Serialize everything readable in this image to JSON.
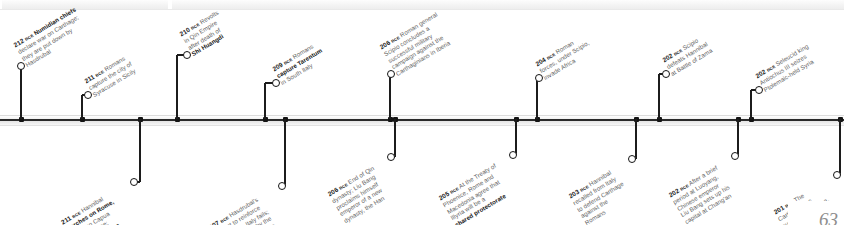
{
  "figure": {
    "type": "historical-timeline",
    "orientation": "horizontal",
    "era_suffix": "BCE",
    "page_number": "63",
    "axis_color": "#1c1c1c",
    "text_color": "#5d5d5d",
    "emphasis_color": "#151515"
  },
  "events": [
    {
      "id": "e-212-numidian",
      "side": "above",
      "year": "212",
      "era": "BCE",
      "lines": [
        {
          "text": "Numidian chiefs",
          "bold": true
        },
        {
          "text": "declare war on Carthage;",
          "bold": false
        },
        {
          "text": "they are put down by",
          "bold": false
        },
        {
          "text": "Hasdrubal",
          "bold": false
        }
      ]
    },
    {
      "id": "e-211-syracuse",
      "side": "above",
      "year": "211",
      "era": "BCE",
      "lines": [
        {
          "text": "Romans",
          "bold": false
        },
        {
          "text": "capture the city of",
          "bold": false
        },
        {
          "text": "Syracuse in Sicily",
          "bold": false
        }
      ]
    },
    {
      "id": "e-210-qin-revolts",
      "side": "above",
      "year": "210",
      "era": "BCE",
      "lines": [
        {
          "text": "Revolts",
          "bold": false
        },
        {
          "text": "in Qin Empire",
          "bold": false
        },
        {
          "text": "after death of",
          "bold": false
        },
        {
          "text": "Shi Huangdi",
          "bold": true
        }
      ]
    },
    {
      "id": "e-209-tarentum",
      "side": "above",
      "year": "209",
      "era": "BCE",
      "lines": [
        {
          "text": "Romans",
          "bold": false
        },
        {
          "text": "capture Tarentum",
          "bold": true
        },
        {
          "text": "in South Italy",
          "bold": false
        }
      ]
    },
    {
      "id": "e-206-scipio-iberia",
      "side": "above",
      "year": "206",
      "era": "BCE",
      "lines": [
        {
          "text": "Roman general",
          "bold": false
        },
        {
          "text": "Scipio concludes a",
          "bold": false
        },
        {
          "text": "successful military",
          "bold": false
        },
        {
          "text": "campaign against the",
          "bold": false
        },
        {
          "text": "Carthaginians in Iberia",
          "bold": false
        }
      ]
    },
    {
      "id": "e-204-invade-africa",
      "side": "above",
      "year": "204",
      "era": "BCE",
      "lines": [
        {
          "text": "Roman",
          "bold": false
        },
        {
          "text": "forces, under Scipio,",
          "bold": false
        },
        {
          "text": "invade Africa",
          "bold": false
        }
      ]
    },
    {
      "id": "e-202-zama",
      "side": "above",
      "year": "202",
      "era": "BCE",
      "lines": [
        {
          "text": "Scipio",
          "bold": false
        },
        {
          "text": "defeats Hannibal",
          "bold": false
        },
        {
          "text": "at Battle of Zama",
          "bold": false
        }
      ]
    },
    {
      "id": "e-202-antiochus",
      "side": "above",
      "year": "202",
      "era": "BCE",
      "lines": [
        {
          "text": "Seleucid king",
          "bold": false
        },
        {
          "text": "Antiochus III seizes",
          "bold": false
        },
        {
          "text": "Ptolemaic-held Syria",
          "bold": false
        }
      ]
    },
    {
      "id": "e-211-marches-rome",
      "side": "below",
      "year": "211",
      "era": "BCE",
      "lines": [
        {
          "text": "Hannibal",
          "bold": false
        },
        {
          "text": "marches on Rome,",
          "bold": true
        },
        {
          "text": "capturing Capua",
          "bold": false
        },
        {
          "text": "and Syracuse;",
          "bold": false
        },
        {
          "text": "Scipio Africanus",
          "bold": true
        },
        {
          "text": "defeats Hasdrubal",
          "bold": false
        },
        {
          "text": "in Spain",
          "bold": false
        }
      ]
    },
    {
      "id": "e-207-metaurus",
      "side": "below",
      "year": "207",
      "era": "BCE",
      "lines": [
        {
          "text": "Hasdrubal's",
          "bold": false
        },
        {
          "text": "attempt to reinforce",
          "bold": false
        },
        {
          "text": "Hannibal in Italy fails;",
          "bold": false
        },
        {
          "text": "he is defeated by the",
          "bold": false
        },
        {
          "text": "Romans at Metaurus",
          "bold": false
        },
        {
          "text": "and killed",
          "bold": false
        }
      ]
    },
    {
      "id": "e-206-han-dynasty",
      "side": "below",
      "year": "206",
      "era": "BCE",
      "lines": [
        {
          "text": "End of Qin",
          "bold": false
        },
        {
          "text": "dynasty; Liu Bang",
          "bold": false
        },
        {
          "text": "proclaims himself",
          "bold": false
        },
        {
          "text": "emperor of a new",
          "bold": false
        },
        {
          "text": "dynasty, the Han",
          "bold": false
        }
      ]
    },
    {
      "id": "e-205-phoenice",
      "side": "below",
      "year": "205",
      "era": "BCE",
      "lines": [
        {
          "text": "At the Treaty of",
          "bold": false
        },
        {
          "text": "Phoenice, Rome and",
          "bold": false
        },
        {
          "text": "Macedonia agree that",
          "bold": false
        },
        {
          "text": "Illyria will be a",
          "bold": false
        },
        {
          "text": "shared protectorate",
          "bold": true
        }
      ]
    },
    {
      "id": "e-203-defend-carthage",
      "side": "below",
      "year": "203",
      "era": "BCE",
      "lines": [
        {
          "text": "Hannibal",
          "bold": false
        },
        {
          "text": "recalled from Italy",
          "bold": false
        },
        {
          "text": "to defend Carthage",
          "bold": false
        },
        {
          "text": "against the",
          "bold": false
        },
        {
          "text": "Romans",
          "bold": false
        }
      ]
    },
    {
      "id": "e-202-changan",
      "side": "below",
      "year": "202",
      "era": "BCE",
      "lines": [
        {
          "text": "After a brief",
          "bold": false
        },
        {
          "text": "period at Luoyang,",
          "bold": false
        },
        {
          "text": "Chinese emperor",
          "bold": false
        },
        {
          "text": "Liu Bang sets up his",
          "bold": false
        },
        {
          "text": "capital at Chang'an",
          "bold": false
        }
      ]
    },
    {
      "id": "e-201-punic-war-end",
      "side": "below",
      "year": "201",
      "era": "BCE",
      "lines": [
        {
          "text": "The",
          "bold": false
        },
        {
          "text": "Carthaginians",
          "bold": false
        },
        {
          "text": "surrender to Rome,",
          "bold": false
        },
        {
          "text": "ending the Second",
          "bold": false
        },
        {
          "text": "Punic War",
          "bold": true
        }
      ]
    }
  ]
}
